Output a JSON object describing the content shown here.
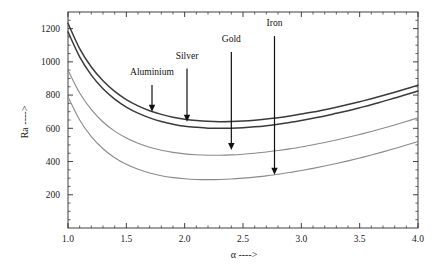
{
  "figure": {
    "background_color": "#ffffff",
    "width": 444,
    "height": 271
  },
  "chart_data": {
    "type": "line",
    "title": "",
    "subtitle": "",
    "xlabel": "α ---->",
    "ylabel": "Ra ---->",
    "xlim": [
      1.0,
      4.0
    ],
    "ylim": [
      0,
      1300
    ],
    "grid": false,
    "legend": "none (inline arrow annotations)",
    "xticks": [
      "1.0",
      "1.5",
      "2.0",
      "2.5",
      "3.0",
      "3.5",
      "4.0"
    ],
    "xtick_values": [
      1.0,
      1.5,
      2.0,
      2.5,
      3.0,
      3.5,
      4.0
    ],
    "yticks": [
      "200",
      "400",
      "600",
      "800",
      "1000",
      "1200"
    ],
    "ytick_values": [
      200,
      400,
      600,
      800,
      1000,
      1200
    ],
    "x": [
      1.0,
      1.1,
      1.2,
      1.3,
      1.4,
      1.5,
      1.6,
      1.7,
      1.8,
      1.9,
      2.0,
      2.1,
      2.2,
      2.3,
      2.4,
      2.5,
      2.6,
      2.7,
      2.8,
      2.9,
      3.0,
      3.1,
      3.2,
      3.3,
      3.4,
      3.5,
      3.6,
      3.7,
      3.8,
      3.9,
      4.0
    ],
    "series": [
      {
        "name": "Aluminium",
        "color": "#3a3a3a",
        "linewidth": 1.5,
        "values": [
          1232,
          1080,
          969,
          886,
          822,
          773,
          735,
          706,
          684,
          667,
          655,
          647,
          642,
          640,
          641,
          644,
          649,
          656,
          664,
          674,
          686,
          698,
          712,
          727,
          743,
          760,
          778,
          797,
          817,
          838,
          860
        ]
      },
      {
        "name": "Silver",
        "color": "#3a3a3a",
        "linewidth": 1.5,
        "values": [
          1180,
          1030,
          920,
          838,
          776,
          728,
          691,
          663,
          641,
          625,
          613,
          606,
          601,
          600,
          601,
          604,
          609,
          616,
          625,
          635,
          647,
          660,
          674,
          690,
          706,
          724,
          742,
          762,
          782,
          803,
          825
        ]
      },
      {
        "name": "Gold",
        "color": "#8a8a8a",
        "linewidth": 1.1,
        "values": [
          950,
          812,
          712,
          638,
          583,
          541,
          510,
          486,
          468,
          455,
          446,
          441,
          438,
          438,
          440,
          444,
          450,
          457,
          466,
          476,
          488,
          501,
          515,
          530,
          546,
          563,
          581,
          600,
          620,
          641,
          663
        ]
      },
      {
        "name": "Iron",
        "color": "#8a8a8a",
        "linewidth": 1.1,
        "values": [
          790,
          650,
          550,
          477,
          423,
          383,
          353,
          331,
          314,
          303,
          296,
          292,
          291,
          292,
          295,
          300,
          306,
          314,
          323,
          334,
          346,
          359,
          373,
          388,
          404,
          421,
          439,
          458,
          478,
          499,
          521
        ]
      }
    ],
    "annotations": [
      {
        "label": "Aluminium",
        "target_series": "Aluminium",
        "x": 1.72,
        "label_x": 1.72,
        "label_y": 920,
        "arrow_from_y": 860,
        "arrow_to_y": 700
      },
      {
        "label": "Silver",
        "target_series": "Silver",
        "x": 2.02,
        "label_x": 2.02,
        "label_y": 1020,
        "arrow_from_y": 960,
        "arrow_to_y": 640
      },
      {
        "label": "Gold",
        "target_series": "Gold",
        "x": 2.4,
        "label_x": 2.4,
        "label_y": 1120,
        "arrow_from_y": 1060,
        "arrow_to_y": 470
      },
      {
        "label": "Iron",
        "target_series": "Iron",
        "x": 2.77,
        "label_x": 2.77,
        "label_y": 1215,
        "arrow_from_y": 1155,
        "arrow_to_y": 320
      }
    ]
  }
}
